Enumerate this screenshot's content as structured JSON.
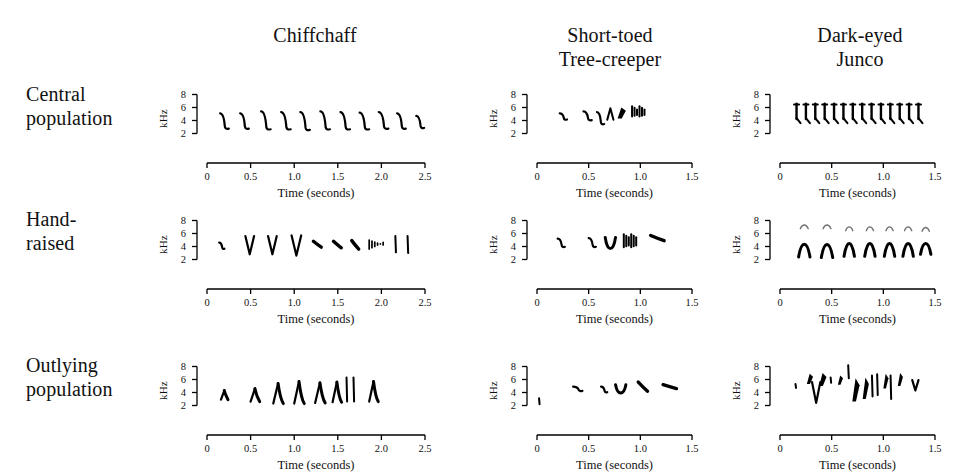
{
  "figure": {
    "background": "#ffffff",
    "ink": "#000000"
  },
  "columns": [
    {
      "id": "chiffchaff",
      "label": "Chiffchaff",
      "label_line1": "Chiffchaff",
      "label_line2": ""
    },
    {
      "id": "treecreeper",
      "label": "Short-toed Tree-creeper",
      "label_line1": "Short-toed",
      "label_line2": "Tree-creeper"
    },
    {
      "id": "junco",
      "label": "Dark-eyed Junco",
      "label_line1": "Dark-eyed",
      "label_line2": "Junco"
    }
  ],
  "rows": [
    {
      "id": "central",
      "label": "Central population",
      "label_line1": "Central",
      "label_line2": "population"
    },
    {
      "id": "hand",
      "label": "Hand-raised",
      "label_line1": "Hand-",
      "label_line2": "raised"
    },
    {
      "id": "outlying",
      "label": "Outlying population",
      "label_line1": "Outlying",
      "label_line2": "population"
    }
  ],
  "axes": {
    "y_label": "kHz",
    "y_ticks": [
      "8",
      "6",
      "4",
      "2"
    ],
    "y_values": [
      8,
      6,
      4,
      2
    ],
    "y_range": [
      1,
      9
    ],
    "x_label": "Time (seconds)",
    "x_ticks_chiffchaff": [
      "0",
      "0.5",
      "1.0",
      "1.5",
      "2.0",
      "2.5"
    ],
    "x_values_chiffchaff": [
      0,
      0.5,
      1.0,
      1.5,
      2.0,
      2.5
    ],
    "x_range_chiffchaff": [
      0,
      2.5
    ],
    "x_ticks_short": [
      "0",
      "0.5",
      "1.0",
      "1.5"
    ],
    "x_values_short": [
      0,
      0.5,
      1.0,
      1.5
    ],
    "x_range_short": [
      0,
      1.5
    ]
  },
  "chart_data": {
    "type": "line",
    "xlabel": "Time (seconds)",
    "ylabel": "kHz",
    "grid": false,
    "legend": "none",
    "panels": [
      {
        "row": "Central population",
        "column": "Chiffchaff",
        "xlim": [
          0,
          2.5
        ],
        "ylim": [
          1,
          9
        ],
        "description": "Eleven stereotyped descending hook notes repeated at a steady rate",
        "elements": [
          {
            "kind": "hook",
            "t": 0.15,
            "f_hi": 5.1,
            "f_lo": 2.6,
            "dur": 0.1
          },
          {
            "kind": "hook",
            "t": 0.38,
            "f_hi": 5.1,
            "f_lo": 2.6,
            "dur": 0.1
          },
          {
            "kind": "hook",
            "t": 0.62,
            "f_hi": 5.4,
            "f_lo": 2.5,
            "dur": 0.11
          },
          {
            "kind": "hook",
            "t": 0.85,
            "f_hi": 5.3,
            "f_lo": 2.5,
            "dur": 0.11
          },
          {
            "kind": "hook",
            "t": 1.07,
            "f_hi": 5.3,
            "f_lo": 2.4,
            "dur": 0.11
          },
          {
            "kind": "hook",
            "t": 1.3,
            "f_hi": 5.4,
            "f_lo": 2.5,
            "dur": 0.11
          },
          {
            "kind": "hook",
            "t": 1.53,
            "f_hi": 5.3,
            "f_lo": 2.5,
            "dur": 0.11
          },
          {
            "kind": "hook",
            "t": 1.75,
            "f_hi": 5.2,
            "f_lo": 2.5,
            "dur": 0.11
          },
          {
            "kind": "hook",
            "t": 1.97,
            "f_hi": 5.3,
            "f_lo": 2.6,
            "dur": 0.11
          },
          {
            "kind": "hook",
            "t": 2.18,
            "f_hi": 5.1,
            "f_lo": 2.6,
            "dur": 0.1
          },
          {
            "kind": "hook",
            "t": 2.4,
            "f_hi": 4.7,
            "f_lo": 2.7,
            "dur": 0.09
          }
        ]
      },
      {
        "row": "Central population",
        "column": "Short-toed Tree-creeper",
        "xlim": [
          0,
          1.5
        ],
        "ylim": [
          1,
          9
        ],
        "description": "A few separated descending notes followed by a dense terminal trill flourish",
        "elements": [
          {
            "kind": "hook",
            "t": 0.22,
            "f_hi": 5.1,
            "f_lo": 4.0,
            "dur": 0.07
          },
          {
            "kind": "hook",
            "t": 0.45,
            "f_hi": 5.4,
            "f_lo": 3.9,
            "dur": 0.08
          },
          {
            "kind": "hook",
            "t": 0.58,
            "f_hi": 5.3,
            "f_lo": 3.3,
            "dur": 0.07
          },
          {
            "kind": "peak",
            "t": 0.68,
            "f_hi": 5.9,
            "f_lo": 4.1,
            "dur": 0.06
          },
          {
            "kind": "blob",
            "t": 0.78,
            "f_hi": 6.0,
            "f_lo": 4.3,
            "dur": 0.08
          },
          {
            "kind": "buzz",
            "t": 0.92,
            "f_hi": 6.2,
            "f_lo": 4.6,
            "dur": 0.12
          }
        ]
      },
      {
        "row": "Central population",
        "column": "Dark-eyed Junco",
        "xlim": [
          0,
          1.5
        ],
        "ylim": [
          1,
          9
        ],
        "description": "Rapid simple trill of fourteen near-identical vertical notes",
        "repeat": {
          "kind": "trillnote",
          "count": 14,
          "t_start": 0.16,
          "t_end": 1.34,
          "f_hi": 6.6,
          "f_lo": 3.6
        }
      },
      {
        "row": "Hand-raised",
        "column": "Chiffchaff",
        "xlim": [
          0,
          2.5
        ],
        "ylim": [
          1,
          9
        ],
        "description": "Irregular mix of V-notes, short hooks, scattered specks and two vertical bars",
        "elements": [
          {
            "kind": "hook",
            "t": 0.14,
            "f_hi": 4.6,
            "f_lo": 3.5,
            "dur": 0.06
          },
          {
            "kind": "vee",
            "t": 0.44,
            "f_hi": 5.6,
            "f_lo": 2.8,
            "dur": 0.1
          },
          {
            "kind": "vee",
            "t": 0.7,
            "f_hi": 5.6,
            "f_lo": 2.8,
            "dur": 0.1
          },
          {
            "kind": "vee",
            "t": 0.97,
            "f_hi": 5.7,
            "f_lo": 2.6,
            "dur": 0.11
          },
          {
            "kind": "dash",
            "t": 1.22,
            "f_hi": 4.8,
            "f_lo": 3.9,
            "dur": 0.09
          },
          {
            "kind": "dash",
            "t": 1.45,
            "f_hi": 4.8,
            "f_lo": 3.8,
            "dur": 0.09
          },
          {
            "kind": "dash",
            "t": 1.66,
            "f_hi": 4.9,
            "f_lo": 3.6,
            "dur": 0.08
          },
          {
            "kind": "speckles",
            "t": 1.86,
            "f_hi": 5.0,
            "f_lo": 3.6,
            "dur": 0.16
          },
          {
            "kind": "bar",
            "t": 2.16,
            "f_hi": 5.6,
            "f_lo": 3.1,
            "dur": 0.03
          },
          {
            "kind": "bar",
            "t": 2.3,
            "f_hi": 5.6,
            "f_lo": 3.0,
            "dur": 0.03
          }
        ]
      },
      {
        "row": "Hand-raised",
        "column": "Short-toed Tree-creeper",
        "xlim": [
          0,
          1.5
        ],
        "ylim": [
          1,
          9
        ],
        "description": "Sparse hooks, a deep U-shaped note and a terminal buzz plus a trailing dash",
        "elements": [
          {
            "kind": "hook",
            "t": 0.2,
            "f_hi": 5.2,
            "f_lo": 3.8,
            "dur": 0.07
          },
          {
            "kind": "hook",
            "t": 0.5,
            "f_hi": 5.3,
            "f_lo": 3.8,
            "dur": 0.07
          },
          {
            "kind": "ushape",
            "t": 0.66,
            "f_hi": 5.4,
            "f_lo": 3.1,
            "dur": 0.1
          },
          {
            "kind": "buzz",
            "t": 0.84,
            "f_hi": 5.9,
            "f_lo": 3.9,
            "dur": 0.12
          },
          {
            "kind": "dash",
            "t": 1.1,
            "f_hi": 5.7,
            "f_lo": 4.9,
            "dur": 0.13
          }
        ]
      },
      {
        "row": "Hand-raised",
        "column": "Dark-eyed Junco",
        "xlim": [
          0,
          1.5
        ],
        "ylim": [
          1,
          9
        ],
        "description": "Seven arched inverted-V notes with faint higher harmonic traces above",
        "elements": [
          {
            "kind": "arch",
            "t": 0.18,
            "f_hi": 5.0,
            "f_lo": 2.4,
            "dur": 0.11,
            "harmonic": 7.2
          },
          {
            "kind": "arch",
            "t": 0.4,
            "f_hi": 5.0,
            "f_lo": 2.3,
            "dur": 0.11,
            "harmonic": 7.2
          },
          {
            "kind": "arch",
            "t": 0.62,
            "f_hi": 5.1,
            "f_lo": 2.5,
            "dur": 0.1,
            "harmonic": 6.9
          },
          {
            "kind": "arch",
            "t": 0.82,
            "f_hi": 5.1,
            "f_lo": 2.5,
            "dur": 0.1,
            "harmonic": 6.9
          },
          {
            "kind": "arch",
            "t": 1.01,
            "f_hi": 5.1,
            "f_lo": 2.5,
            "dur": 0.1,
            "harmonic": 6.9
          },
          {
            "kind": "arch",
            "t": 1.19,
            "f_hi": 5.1,
            "f_lo": 2.5,
            "dur": 0.1,
            "harmonic": 6.9
          },
          {
            "kind": "arch",
            "t": 1.36,
            "f_hi": 5.0,
            "f_lo": 2.8,
            "dur": 0.1,
            "harmonic": 6.8
          }
        ]
      },
      {
        "row": "Outlying population",
        "column": "Chiffchaff",
        "xlim": [
          0,
          2.5
        ],
        "ylim": [
          1,
          9
        ],
        "description": "Eight arrow-shaped notes with a steep upstroke and trailing downsweep; two tall bars near 1.5 s",
        "elements": [
          {
            "kind": "arrow",
            "t": 0.16,
            "f_hi": 4.3,
            "f_lo": 2.9,
            "dur": 0.07
          },
          {
            "kind": "arrow",
            "t": 0.5,
            "f_hi": 4.6,
            "f_lo": 2.6,
            "dur": 0.09
          },
          {
            "kind": "arrow",
            "t": 0.76,
            "f_hi": 5.4,
            "f_lo": 2.3,
            "dur": 0.1
          },
          {
            "kind": "arrow",
            "t": 1.0,
            "f_hi": 5.7,
            "f_lo": 2.3,
            "dur": 0.1
          },
          {
            "kind": "arrow",
            "t": 1.24,
            "f_hi": 5.5,
            "f_lo": 2.4,
            "dur": 0.1
          },
          {
            "kind": "arrow",
            "t": 1.44,
            "f_hi": 5.6,
            "f_lo": 2.5,
            "dur": 0.09
          },
          {
            "kind": "bar",
            "t": 1.6,
            "f_hi": 6.3,
            "f_lo": 2.6,
            "dur": 0.03
          },
          {
            "kind": "bar",
            "t": 1.68,
            "f_hi": 6.3,
            "f_lo": 2.6,
            "dur": 0.03
          },
          {
            "kind": "arrow",
            "t": 1.86,
            "f_hi": 5.7,
            "f_lo": 2.6,
            "dur": 0.09
          }
        ]
      },
      {
        "row": "Outlying population",
        "column": "Short-toed Tree-creeper",
        "xlim": [
          0,
          1.5
        ],
        "ylim": [
          1,
          9
        ],
        "description": "A low onset tick then five short thick notes, ending with a flat double dash",
        "elements": [
          {
            "kind": "tick",
            "t": 0.02,
            "f_hi": 3.1,
            "f_lo": 2.2,
            "dur": 0.02
          },
          {
            "kind": "hook",
            "t": 0.35,
            "f_hi": 4.9,
            "f_lo": 4.1,
            "dur": 0.09
          },
          {
            "kind": "hook",
            "t": 0.62,
            "f_hi": 4.9,
            "f_lo": 3.9,
            "dur": 0.06
          },
          {
            "kind": "ushape",
            "t": 0.76,
            "f_hi": 5.2,
            "f_lo": 3.5,
            "dur": 0.1
          },
          {
            "kind": "dash",
            "t": 0.98,
            "f_hi": 5.6,
            "f_lo": 4.2,
            "dur": 0.09
          },
          {
            "kind": "dash",
            "t": 1.22,
            "f_hi": 5.2,
            "f_lo": 4.6,
            "dur": 0.13
          }
        ]
      },
      {
        "row": "Outlying population",
        "column": "Dark-eyed Junco",
        "xlim": [
          0,
          1.5
        ],
        "ylim": [
          1,
          9
        ],
        "description": "Complex irregular phrase: many dense angled blobs and strokes spanning 2 to 8 kHz",
        "elements": [
          {
            "kind": "tick",
            "t": 0.15,
            "f_hi": 5.3,
            "f_lo": 4.7,
            "dur": 0.02
          },
          {
            "kind": "blob",
            "t": 0.26,
            "f_hi": 6.9,
            "f_lo": 5.3,
            "dur": 0.06
          },
          {
            "kind": "vee",
            "t": 0.31,
            "f_hi": 5.6,
            "f_lo": 2.4,
            "dur": 0.08
          },
          {
            "kind": "blob",
            "t": 0.38,
            "f_hi": 7.0,
            "f_lo": 5.0,
            "dur": 0.07
          },
          {
            "kind": "tick",
            "t": 0.49,
            "f_hi": 6.3,
            "f_lo": 5.5,
            "dur": 0.02
          },
          {
            "kind": "blob",
            "t": 0.56,
            "f_hi": 6.6,
            "f_lo": 5.2,
            "dur": 0.05
          },
          {
            "kind": "bar",
            "t": 0.66,
            "f_hi": 8.2,
            "f_lo": 6.2,
            "dur": 0.03
          },
          {
            "kind": "blob",
            "t": 0.7,
            "f_hi": 6.2,
            "f_lo": 2.6,
            "dur": 0.07
          },
          {
            "kind": "blob",
            "t": 0.8,
            "f_hi": 6.3,
            "f_lo": 3.0,
            "dur": 0.06
          },
          {
            "kind": "bar",
            "t": 0.89,
            "f_hi": 6.6,
            "f_lo": 3.4,
            "dur": 0.02
          },
          {
            "kind": "bar",
            "t": 0.94,
            "f_hi": 6.8,
            "f_lo": 3.6,
            "dur": 0.02
          },
          {
            "kind": "blob",
            "t": 1.0,
            "f_hi": 6.9,
            "f_lo": 4.6,
            "dur": 0.05
          },
          {
            "kind": "bar",
            "t": 1.07,
            "f_hi": 6.6,
            "f_lo": 3.0,
            "dur": 0.02
          },
          {
            "kind": "blob",
            "t": 1.14,
            "f_hi": 7.0,
            "f_lo": 5.0,
            "dur": 0.05
          },
          {
            "kind": "vee",
            "t": 1.28,
            "f_hi": 5.9,
            "f_lo": 4.3,
            "dur": 0.06
          }
        ]
      }
    ]
  }
}
